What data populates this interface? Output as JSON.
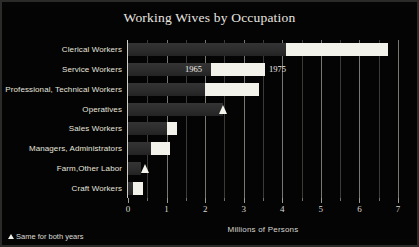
{
  "title": "Working Wives by Occupation",
  "footnote": {
    "marker_icon": "triangle-up-icon",
    "text": "Same for both years"
  },
  "annotations": {
    "series_1_label": "1965",
    "series_2_label": "1975"
  },
  "chart_data": {
    "type": "bar",
    "orientation": "horizontal",
    "title": "Working Wives by Occupation",
    "subtitle": "",
    "xlabel": "Millions of Persons",
    "ylabel": "",
    "xlim": [
      0,
      7
    ],
    "xticks": [
      0,
      1,
      2,
      3,
      4,
      5,
      6,
      7
    ],
    "xticklabels": [
      "0",
      "1",
      "2",
      "3",
      "4",
      "5",
      "6",
      "7"
    ],
    "minor_ticks": [
      0.5,
      1.5,
      2.5,
      3.5,
      4.5,
      5.5,
      6.5
    ],
    "grid": "vertical",
    "legend": "inline annotations on Service Workers bar",
    "categories": [
      "Clerical Workers",
      "Service Workers",
      "Professional, Technical Workers",
      "Operatives",
      "Sales Workers",
      "Managers, Administrators",
      "Farm,Other Labor",
      "Craft Workers"
    ],
    "series": [
      {
        "name": "1965",
        "color": "#2e2e2e",
        "values": [
          4.1,
          2.15,
          2.0,
          2.45,
          1.0,
          0.6,
          0.34,
          0.12
        ]
      },
      {
        "name": "1975",
        "color": "#f2f1ea",
        "values": [
          6.75,
          3.55,
          3.4,
          2.45,
          1.27,
          1.1,
          0.45,
          0.4
        ]
      }
    ],
    "same_for_both_years": [
      "Operatives",
      "Farm,Other Labor"
    ]
  },
  "colors": {
    "background": "#040404",
    "bar_1965": "#2e2e2e",
    "bar_1975": "#f2f1ea",
    "gridline": "#8d8d86",
    "text": "#e6e4dd"
  }
}
